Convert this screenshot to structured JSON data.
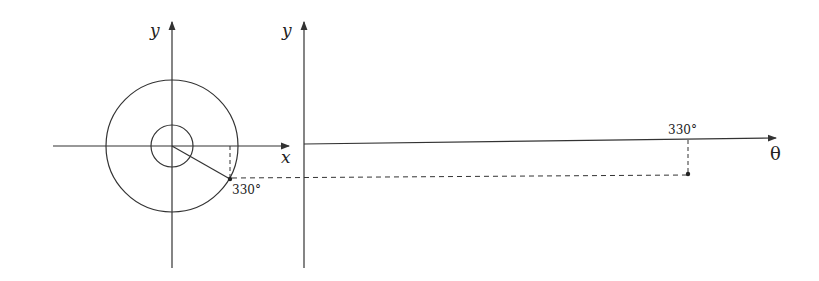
{
  "diagram": {
    "left_panel": {
      "y_axis_label": "y",
      "x_axis_label": "x",
      "angle_label": "330°",
      "description": "Unit circle with radius vector at 330 degrees"
    },
    "right_panel": {
      "y_axis_label": "y",
      "theta_axis_label": "θ",
      "angle_tick_label": "330°",
      "description": "Graph of y versus theta with point at 330 degrees"
    },
    "colors": {
      "stroke": "#333333",
      "background": "#ffffff"
    }
  }
}
